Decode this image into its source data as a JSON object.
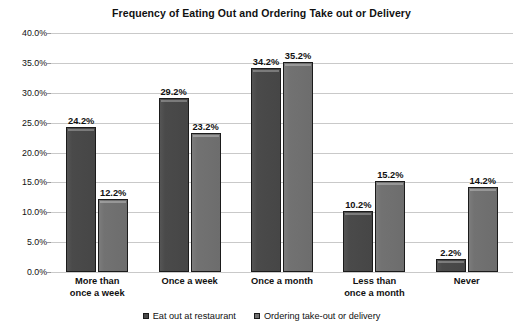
{
  "chart_data": {
    "type": "bar",
    "title": "Frequency of Eating Out and Ordering Take out or Delivery",
    "xlabel": "",
    "ylabel": "",
    "ylim": [
      0,
      40
    ],
    "yticks": [
      "0.0%",
      "5.0%",
      "10.0%",
      "15.0%",
      "20.0%",
      "25.0%",
      "30.0%",
      "35.0%",
      "40.0%"
    ],
    "ytick_values": [
      0,
      5,
      10,
      15,
      20,
      25,
      30,
      35,
      40
    ],
    "grid": true,
    "legend_position": "bottom",
    "categories": [
      "More than once a week",
      "Once a week",
      "Once a month",
      "Less than once a month",
      "Never"
    ],
    "category_lines": [
      [
        "More than",
        "once a week"
      ],
      [
        "Once a week"
      ],
      [
        "Once a month"
      ],
      [
        "Less than",
        "once a month"
      ],
      [
        "Never"
      ]
    ],
    "series": [
      {
        "name": "Eat out at restaurant",
        "color": "#4a4a4a",
        "values": [
          24.2,
          29.2,
          34.2,
          10.2,
          2.2
        ],
        "labels": [
          "24.2%",
          "29.2%",
          "34.2%",
          "10.2%",
          "2.2%"
        ]
      },
      {
        "name": "Ordering take-out or delivery",
        "color": "#727272",
        "values": [
          12.2,
          23.2,
          35.2,
          15.2,
          14.2
        ],
        "labels": [
          "12.2%",
          "23.2%",
          "35.2%",
          "15.2%",
          "14.2%"
        ]
      }
    ]
  }
}
